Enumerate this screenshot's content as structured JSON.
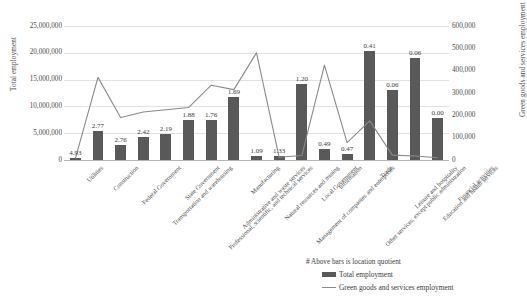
{
  "chart_data": {
    "type": "bar",
    "title": "",
    "categories": [
      "Utilities",
      "Construction",
      "Federal Government",
      "Transportation and warehousing",
      "State Government",
      "Professional, scientific, and technical services",
      "Administrative and waste services",
      "Manufacturing",
      "Natural resources and mining",
      "Management of companies and enterprises",
      "Local Government",
      "Information",
      "Other services, except public administration",
      "Trade",
      "Leisure and hospitality",
      "Education and health services",
      "Financial activities"
    ],
    "series": [
      {
        "name": "Total employment",
        "type": "bar",
        "axis": "left",
        "values": [
          400000,
          5500000,
          2800000,
          4200000,
          4800000,
          7500000,
          7400000,
          11700000,
          700000,
          800000,
          14200000,
          2000000,
          1200000,
          20400000,
          13100000,
          19000000,
          7900000
        ]
      },
      {
        "name": "Green goods and services employment",
        "type": "line",
        "axis": "right",
        "values": [
          6000,
          370000,
          190000,
          215000,
          225000,
          235000,
          335000,
          315000,
          480000,
          12000,
          20000,
          425000,
          78000,
          175000,
          22000,
          18000,
          10000
        ]
      }
    ],
    "data_labels": {
      "name": "location quotient",
      "values": [
        "4.93",
        "2.77",
        "2.76",
        "2.42",
        "2.19",
        "1.88",
        "1.76",
        "1.69",
        "1.09",
        "1.33",
        "1.20",
        "0.49",
        "0.47",
        "0.41",
        "0.06",
        "0.06",
        "0.00"
      ]
    },
    "xlabel": "",
    "ylabel": "Total employment",
    "y2label": "Green goods and services employment",
    "ylim": [
      0,
      25000000
    ],
    "y2lim": [
      0,
      600000
    ],
    "yticks": [
      "0",
      "5,000,000",
      "10,000,000",
      "15,000,000",
      "20,000,000",
      "25,000,000"
    ],
    "y2ticks": [
      "0",
      "100,000",
      "200,000",
      "300,000",
      "400,000",
      "500,000",
      "600,000"
    ],
    "grid": true,
    "legend_position": "bottom-right",
    "colors": {
      "bar": "#595959",
      "line": "#8a8a8a",
      "grid": "#e2e2e2"
    }
  },
  "annotation": {
    "note": "# Above bars is location quotient"
  },
  "legend": {
    "items": [
      {
        "label": "Total employment",
        "marker": "bar-swatch"
      },
      {
        "label": "Green goods and services employment",
        "marker": "line-swatch"
      }
    ]
  }
}
